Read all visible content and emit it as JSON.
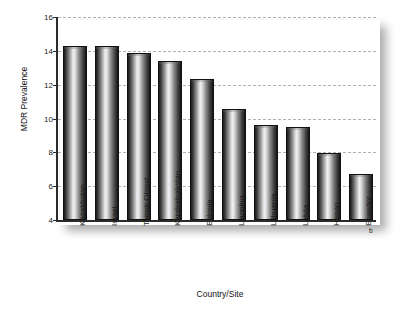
{
  "figure": {
    "title_fragment": "Figure",
    "background": "#ffffff"
  },
  "chart_data": {
    "type": "bar",
    "title": "",
    "xlabel": "Country/Site",
    "ylabel": "MDR Prevalence",
    "categories": [
      "Kazakhstan",
      "Israel",
      "Tomsk Oblast",
      "Karakalpakstan",
      "Estonia",
      "Liaoning",
      "Lithuania",
      "Latvia",
      "Henan",
      "Ecuador"
    ],
    "values": [
      14.3,
      14.3,
      13.9,
      13.4,
      12.35,
      10.55,
      9.6,
      9.5,
      7.95,
      6.7
    ],
    "ylim": [
      4,
      16
    ],
    "yticks": [
      4,
      6,
      8,
      10,
      12,
      14,
      16
    ],
    "grid": true,
    "legend": "none",
    "bar_color": "#3b3b3b",
    "grid_color": "#a9b4bd",
    "axis_color": "#2b2b2b",
    "footnote_marker": "b",
    "footnote_marker_category": "Ecuador"
  }
}
